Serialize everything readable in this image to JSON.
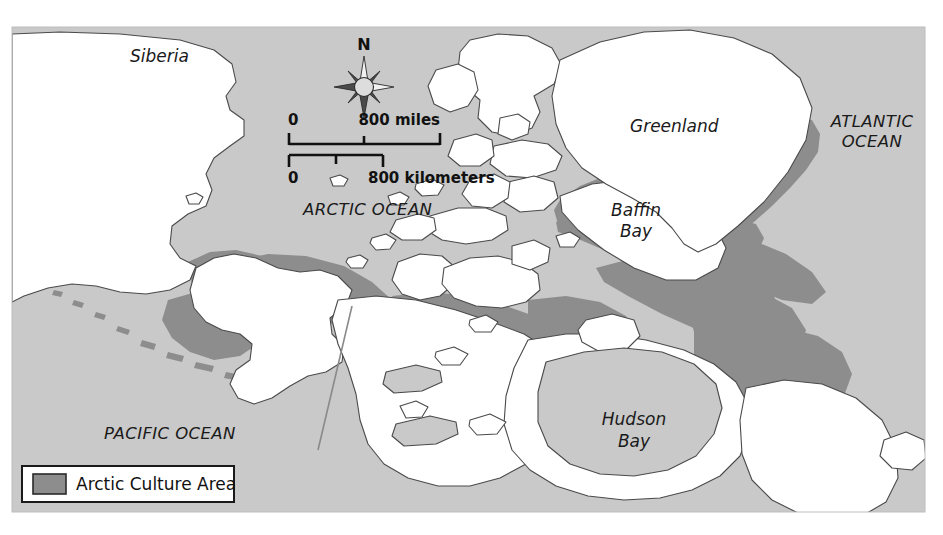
{
  "figure": {
    "kind": "thematic-map",
    "region": "Arctic / North America",
    "frame": {
      "x": 12,
      "y": 27,
      "width": 913,
      "height": 485
    }
  },
  "colors": {
    "ocean_fill": "#c9c9c9",
    "land_fill": "#ffffff",
    "culture_area_fill": "#8d8d8d",
    "coastline_stroke": "#4a4a4a",
    "text": "#1a1a1a",
    "legend_background": "#ffffff",
    "legend_border": "#1a1a1a",
    "page_background": "#ffffff"
  },
  "labels": {
    "siberia": "Siberia",
    "arctic_ocean": "ARCTIC OCEAN",
    "pacific_ocean": "PACIFIC OCEAN",
    "atlantic_ocean_line1": "ATLANTIC",
    "atlantic_ocean_line2": "OCEAN",
    "greenland": "Greenland",
    "baffin_bay_line1": "Baffin",
    "baffin_bay_line2": "Bay",
    "hudson_bay_line1": "Hudson",
    "hudson_bay_line2": "Bay"
  },
  "compass": {
    "north_letter": "N",
    "points": 8
  },
  "scale_bars": [
    {
      "id": "miles",
      "zero_label": "0",
      "max_label": "800 miles",
      "max_value": 800,
      "unit": "miles",
      "ticks": [
        0,
        400,
        800
      ]
    },
    {
      "id": "kilometers",
      "zero_label": "0",
      "max_label": "800 kilometers",
      "max_value": 800,
      "unit": "kilometers",
      "ticks": [
        0,
        400,
        800
      ]
    }
  ],
  "legend": {
    "title": null,
    "entries": [
      {
        "swatch_color": "#8d8d8d",
        "label": "Arctic Culture Area"
      }
    ]
  }
}
